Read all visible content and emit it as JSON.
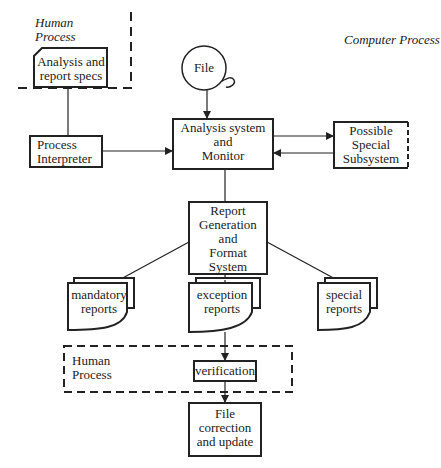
{
  "colors": {
    "ink": "#222222",
    "background": "#ffffff"
  },
  "regions": {
    "human_top": {
      "line1": "Human",
      "line2": "Process"
    },
    "computer": {
      "label": "Computer Process"
    },
    "human_bottom": {
      "line1": "Human",
      "line2": "Process"
    }
  },
  "nodes": {
    "specs": {
      "line1": "Analysis and",
      "line2": "report specs",
      "shape": "card"
    },
    "file": {
      "label": "File",
      "shape": "disk-circle"
    },
    "interpreter": {
      "line1": "Process",
      "line2": "Interpreter",
      "shape": "box"
    },
    "analysis": {
      "line1": "Analysis system",
      "line2": "and",
      "line3": "Monitor",
      "shape": "box"
    },
    "subsystem": {
      "line1": "Possible",
      "line2": "Special",
      "line3": "Subsystem",
      "shape": "box"
    },
    "report_gen": {
      "line1": "Report",
      "line2": "Generation",
      "line3": "and",
      "line4": "Format",
      "line5": "System",
      "shape": "box"
    },
    "mandatory": {
      "line1": "mandatory",
      "line2": "reports",
      "shape": "document-stack"
    },
    "exception": {
      "line1": "exception",
      "line2": "reports",
      "shape": "document-stack"
    },
    "special": {
      "line1": "special",
      "line2": "reports",
      "shape": "document-stack"
    },
    "verification": {
      "label": "verification",
      "shape": "box"
    },
    "file_correction": {
      "line1": "File",
      "line2": "correction",
      "line3": "and update",
      "shape": "box"
    }
  },
  "edges": [
    {
      "from": "specs",
      "to": "interpreter"
    },
    {
      "from": "file",
      "to": "analysis"
    },
    {
      "from": "interpreter",
      "to": "analysis"
    },
    {
      "from": "analysis",
      "to": "subsystem"
    },
    {
      "from": "subsystem",
      "to": "analysis"
    },
    {
      "from": "analysis",
      "to": "report_gen"
    },
    {
      "from": "report_gen",
      "to": "mandatory"
    },
    {
      "from": "report_gen",
      "to": "exception"
    },
    {
      "from": "report_gen",
      "to": "special"
    },
    {
      "from": "exception",
      "to": "verification"
    },
    {
      "from": "verification",
      "to": "file_correction"
    }
  ]
}
